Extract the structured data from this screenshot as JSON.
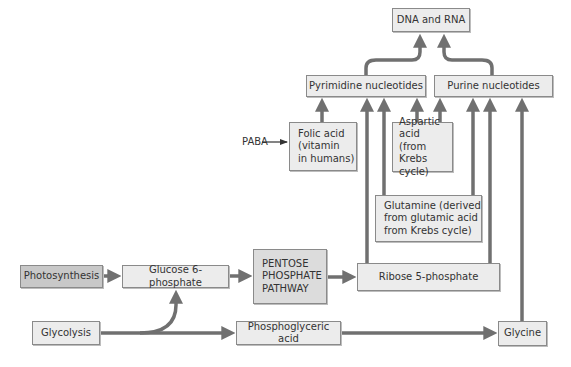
{
  "diagram": {
    "colors": {
      "arrow": "#707070",
      "box_fill": "#ececec",
      "box_border": "#8a8a8a",
      "dark_fill": "#c8c8c8",
      "pentose_fill": "#dcdcdc"
    },
    "nodes": {
      "dna_rna": "DNA and RNA",
      "pyrimidine": "Pyrimidine nucleotides",
      "purine": "Purine nucleotides",
      "folic_acid": "Folic acid\n(vitamin\nin humans)",
      "aspartic_acid": "Aspartic acid\n(from Krebs\ncycle)",
      "glutamine": "Glutamine (derived\nfrom glutamic acid\nfrom Krebs cycle)",
      "photosynthesis": "Photosynthesis",
      "glucose6p": "Glucose 6-phosphate",
      "pentose": "PENTOSE\nPHOSPHATE\nPATHWAY",
      "ribose5p": "Ribose 5-phosphate",
      "glycolysis": "Glycolysis",
      "phosphoglyceric": "Phosphoglyceric acid",
      "glycine": "Glycine"
    },
    "labels": {
      "paba": "PABA"
    },
    "edges": [
      {
        "from": "PABA",
        "to": "Folic acid"
      },
      {
        "from": "Folic acid",
        "to": "Pyrimidine nucleotides"
      },
      {
        "from": "Aspartic acid",
        "to": "Pyrimidine nucleotides"
      },
      {
        "from": "Aspartic acid",
        "to": "Purine nucleotides"
      },
      {
        "from": "Glutamine",
        "to": "Pyrimidine nucleotides"
      },
      {
        "from": "Glutamine",
        "to": "Purine nucleotides"
      },
      {
        "from": "Ribose 5-phosphate",
        "to": "Pyrimidine nucleotides"
      },
      {
        "from": "Ribose 5-phosphate",
        "to": "Purine nucleotides"
      },
      {
        "from": "Glycine",
        "to": "Purine nucleotides"
      },
      {
        "from": "Pyrimidine nucleotides",
        "to": "DNA and RNA"
      },
      {
        "from": "Purine nucleotides",
        "to": "DNA and RNA"
      },
      {
        "from": "Photosynthesis",
        "to": "Glucose 6-phosphate"
      },
      {
        "from": "Glycolysis",
        "to": "Glucose 6-phosphate"
      },
      {
        "from": "Glycolysis",
        "to": "Phosphoglyceric acid"
      },
      {
        "from": "Glucose 6-phosphate",
        "to": "PENTOSE PHOSPHATE PATHWAY"
      },
      {
        "from": "PENTOSE PHOSPHATE PATHWAY",
        "to": "Ribose 5-phosphate"
      },
      {
        "from": "Phosphoglyceric acid",
        "to": "Glycine"
      }
    ]
  }
}
